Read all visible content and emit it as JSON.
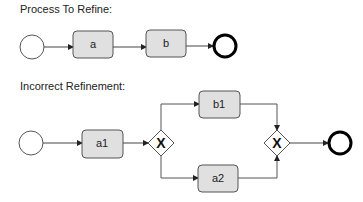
{
  "sections": {
    "process": {
      "title": "Process To Refine:",
      "tasks": [
        {
          "label": "a"
        },
        {
          "label": "b"
        }
      ]
    },
    "refinement": {
      "title": "Incorrect Refinement:",
      "tasks": [
        {
          "label": "a1"
        },
        {
          "label": "b1"
        },
        {
          "label": "a2"
        }
      ],
      "gateways": [
        {
          "type": "exclusive",
          "symbol": "X"
        },
        {
          "type": "exclusive",
          "symbol": "X"
        }
      ]
    }
  },
  "colors": {
    "task_fill": "#e0e0e0",
    "stroke": "#444444",
    "end_event_stroke": "#000000"
  }
}
